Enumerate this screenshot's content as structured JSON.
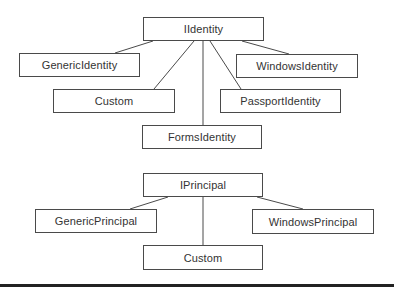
{
  "diagram": {
    "groups": [
      {
        "name": "identity-hierarchy",
        "root": {
          "id": "iidentity",
          "label": "IIdentity",
          "box": [
            143,
            17,
            121,
            24
          ]
        },
        "children": [
          {
            "id": "generic-identity",
            "label": "GenericIdentity",
            "box": [
              19,
              53,
              121,
              24
            ],
            "edge": [
              153,
              41,
              115,
              53
            ]
          },
          {
            "id": "custom-identity",
            "label": "Custom",
            "box": [
              53,
              89,
              122,
              24
            ],
            "edge": [
              194,
              41,
              154,
              89
            ]
          },
          {
            "id": "forms-identity",
            "label": "FormsIdentity",
            "box": [
              142,
              125,
              120,
              24
            ],
            "edge": [
              203,
              41,
              203,
              125
            ]
          },
          {
            "id": "passport-identity",
            "label": "PassportIdentity",
            "box": [
              220,
              89,
              121,
              24
            ],
            "edge": [
              210,
              41,
              241,
              89
            ]
          },
          {
            "id": "windows-identity",
            "label": "WindowsIdentity",
            "box": [
              236,
              54,
              122,
              24
            ],
            "edge": [
              242,
              41,
              289,
              54
            ]
          }
        ]
      },
      {
        "name": "principal-hierarchy",
        "root": {
          "id": "iprincipal",
          "label": "IPrincipal",
          "box": [
            143,
            173,
            120,
            24
          ]
        },
        "children": [
          {
            "id": "generic-principal",
            "label": "GenericPrincipal",
            "box": [
              35,
              209,
              122,
              24
            ],
            "edge": [
              168,
              197,
              130,
              209
            ]
          },
          {
            "id": "custom-principal",
            "label": "Custom",
            "box": [
              143,
              245,
              120,
              25
            ],
            "edge": [
              203,
              197,
              203,
              245
            ]
          },
          {
            "id": "windows-principal",
            "label": "WindowsPrincipal",
            "box": [
              252,
              209,
              122,
              25
            ],
            "edge": [
              257,
              197,
              303,
              209
            ]
          }
        ]
      }
    ],
    "colors": {
      "stroke": "#4a4a4a",
      "text": "#333333",
      "rule": "#222222"
    }
  }
}
